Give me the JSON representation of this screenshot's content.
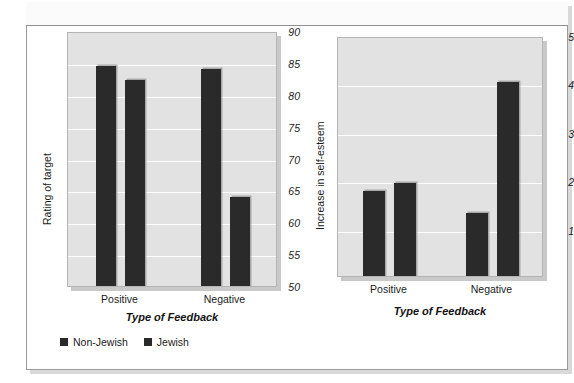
{
  "figure": {
    "background": "#ffffff",
    "frame_border_color": "#9a9a9a"
  },
  "legend": {
    "position": "bottom-left",
    "swatch_color": "#2a2a2a",
    "entries": [
      {
        "label": "Non-Jewish"
      },
      {
        "label": "Jewish"
      }
    ]
  },
  "chart_data": [
    {
      "id": "rating-of-target",
      "type": "bar",
      "title": "",
      "xlabel": "Type of Feedback",
      "ylabel": "Rating of target",
      "categories": [
        "Positive",
        "Negative"
      ],
      "ylim": [
        50,
        90
      ],
      "yticks": [
        50,
        55,
        60,
        65,
        70,
        75,
        80,
        85,
        90
      ],
      "ytick_labels": [
        "50",
        "55",
        "60",
        "65",
        "70",
        "75",
        "80",
        "85",
        "90"
      ],
      "grid": true,
      "grid_axis": "y",
      "legend_position": "bottom-left",
      "bar_color": "#2a2a2a",
      "plot_background": "#e2e2e2",
      "series": [
        {
          "name": "Non-Jewish",
          "values": [
            84.9,
            84.3
          ]
        },
        {
          "name": "Jewish",
          "values": [
            82.7,
            64.3
          ]
        }
      ]
    },
    {
      "id": "increase-in-self-esteem",
      "type": "bar",
      "title": "",
      "xlabel": "Type of Feedback",
      "ylabel": "Increase in self-esteem",
      "categories": [
        "Positive",
        "Negative"
      ],
      "ylim": [
        0.05,
        5
      ],
      "yticks": [
        1,
        2,
        3,
        4,
        5
      ],
      "ytick_labels": [
        "1",
        "2",
        "3",
        "4",
        "5"
      ],
      "grid": true,
      "grid_axis": "y",
      "legend_position": "bottom-left",
      "bar_color": "#2a2a2a",
      "plot_background": "#e2e2e2",
      "series": [
        {
          "name": "Non-Jewish",
          "values": [
            1.85,
            1.4
          ]
        },
        {
          "name": "Jewish",
          "values": [
            2.0,
            4.1
          ]
        }
      ]
    }
  ]
}
